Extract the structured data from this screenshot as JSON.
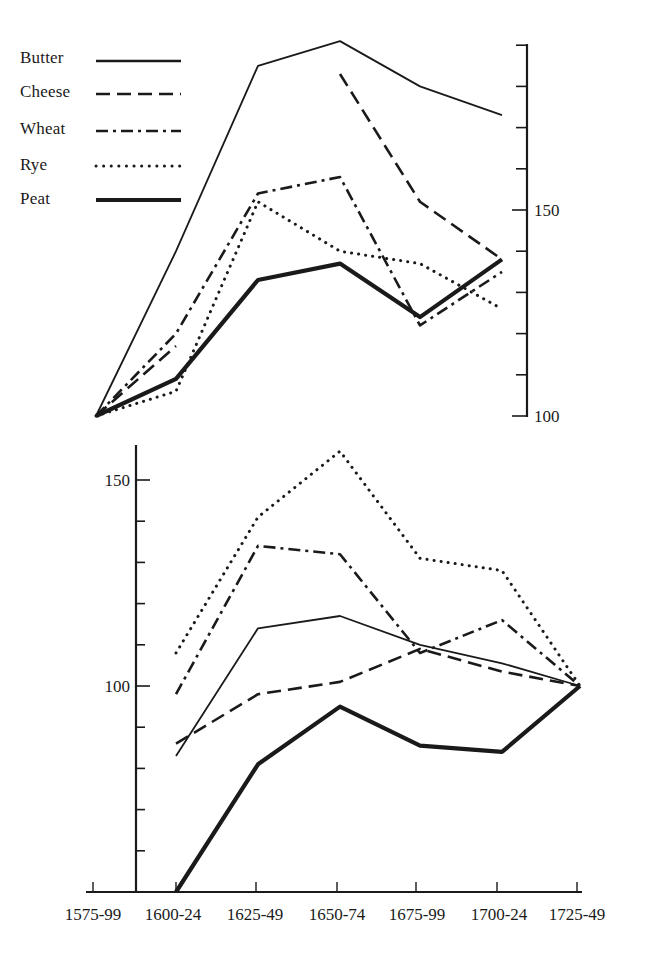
{
  "chart_data": [
    {
      "panel": "upper",
      "type": "line",
      "title": "",
      "xlabel": "",
      "ylabel": "",
      "categories": [
        "1575-99",
        "1600-24",
        "1625-49",
        "1650-74",
        "1675-99",
        "1700-24",
        "1725-49"
      ],
      "ylim": [
        100,
        190
      ],
      "yticks": [
        100,
        110,
        120,
        130,
        140,
        150,
        160,
        170,
        180,
        190
      ],
      "ytick_labels": [
        {
          "value": 100,
          "label": "100"
        },
        {
          "value": 150,
          "label": "150"
        }
      ],
      "axis_position": "right",
      "grid": false,
      "series": [
        {
          "name": "Butter",
          "style": "solid",
          "values": [
            100,
            140,
            185,
            191,
            180,
            173,
            null
          ]
        },
        {
          "name": "Cheese",
          "style": "dashed",
          "values": [
            100,
            117,
            null,
            183,
            152,
            138,
            null
          ]
        },
        {
          "name": "Wheat",
          "style": "dash-dot",
          "values": [
            100,
            120,
            154,
            158,
            122,
            135,
            null
          ]
        },
        {
          "name": "Rye",
          "style": "dotted",
          "values": [
            100,
            106,
            152,
            140,
            137,
            126,
            null
          ]
        },
        {
          "name": "Peat",
          "style": "thick",
          "values": [
            100,
            109,
            133,
            137,
            124,
            138,
            null
          ]
        }
      ]
    },
    {
      "panel": "lower",
      "type": "line",
      "title": "",
      "xlabel": "",
      "ylabel": "",
      "categories": [
        "1575-99",
        "1600-24",
        "1625-49",
        "1650-74",
        "1675-99",
        "1700-24",
        "1725-49"
      ],
      "ylim": [
        50,
        160
      ],
      "yticks": [
        50,
        60,
        70,
        80,
        90,
        100,
        110,
        120,
        130,
        140,
        150
      ],
      "ytick_labels": [
        {
          "value": 100,
          "label": "100"
        },
        {
          "value": 150,
          "label": "150"
        }
      ],
      "axis_position": "left",
      "grid": false,
      "series": [
        {
          "name": "Butter",
          "style": "solid",
          "values": [
            null,
            83,
            114,
            117,
            110,
            105.5,
            100
          ]
        },
        {
          "name": "Cheese",
          "style": "dashed",
          "values": [
            null,
            86,
            98,
            101,
            109,
            103.5,
            100
          ]
        },
        {
          "name": "Wheat",
          "style": "dash-dot",
          "values": [
            null,
            98,
            134,
            132,
            108,
            116,
            100
          ]
        },
        {
          "name": "Rye",
          "style": "dotted",
          "values": [
            null,
            108,
            141,
            157,
            131,
            128,
            100
          ]
        },
        {
          "name": "Peat",
          "style": "thick",
          "values": [
            null,
            50,
            81,
            95,
            85.5,
            84,
            100
          ]
        }
      ]
    }
  ],
  "legend": {
    "position": "upper-left",
    "items": [
      {
        "label": "Butter",
        "style": "solid"
      },
      {
        "label": "Cheese",
        "style": "dashed"
      },
      {
        "label": "Wheat",
        "style": "dash-dot"
      },
      {
        "label": "Rye",
        "style": "dotted"
      },
      {
        "label": "Peat",
        "style": "thick"
      }
    ]
  },
  "x_axis": {
    "labels": [
      "1575-99",
      "1600-24",
      "1625-49",
      "1650-74",
      "1675-99",
      "1700-24",
      "1725-49"
    ]
  },
  "colors": {
    "ink": "#1a1a1a",
    "background": "#ffffff"
  }
}
